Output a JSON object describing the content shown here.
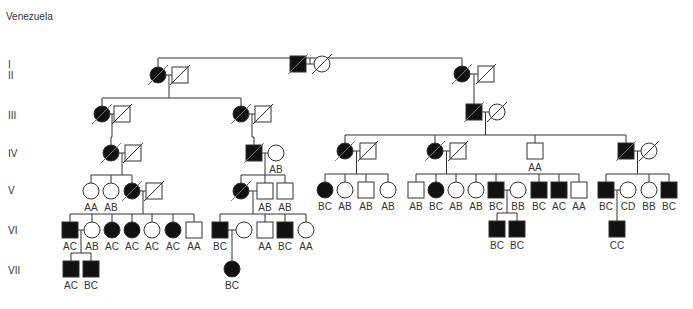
{
  "title": "Venezuela",
  "generations": [
    "I",
    "II",
    "III",
    "IV",
    "V",
    "VI",
    "VII"
  ],
  "gen_y": [
    64,
    75,
    115,
    153,
    190,
    230,
    270
  ],
  "colors": {
    "line": "#333333",
    "affected": "#111111",
    "unaffected": "#ffffff"
  },
  "individuals": [
    {
      "id": "I-1",
      "sex": "M",
      "affected": true,
      "deceased": true,
      "x": 298,
      "y": 64,
      "genotype": ""
    },
    {
      "id": "I-2",
      "sex": "F",
      "affected": false,
      "deceased": true,
      "x": 322,
      "y": 64,
      "genotype": ""
    },
    {
      "id": "II-1",
      "sex": "F",
      "affected": true,
      "deceased": true,
      "x": 158,
      "y": 75,
      "genotype": ""
    },
    {
      "id": "II-2",
      "sex": "M",
      "affected": false,
      "deceased": true,
      "x": 180,
      "y": 75,
      "genotype": ""
    },
    {
      "id": "II-3",
      "sex": "F",
      "affected": true,
      "deceased": true,
      "x": 462,
      "y": 74,
      "genotype": ""
    },
    {
      "id": "II-4",
      "sex": "M",
      "affected": false,
      "deceased": true,
      "x": 486,
      "y": 74,
      "genotype": ""
    },
    {
      "id": "III-1",
      "sex": "F",
      "affected": true,
      "deceased": true,
      "x": 102,
      "y": 114,
      "genotype": ""
    },
    {
      "id": "III-2",
      "sex": "M",
      "affected": false,
      "deceased": true,
      "x": 122,
      "y": 114,
      "genotype": ""
    },
    {
      "id": "III-3",
      "sex": "F",
      "affected": true,
      "deceased": true,
      "x": 241,
      "y": 114,
      "genotype": ""
    },
    {
      "id": "III-4",
      "sex": "M",
      "affected": false,
      "deceased": true,
      "x": 263,
      "y": 114,
      "genotype": ""
    },
    {
      "id": "III-5",
      "sex": "M",
      "affected": true,
      "deceased": true,
      "x": 474,
      "y": 112,
      "genotype": ""
    },
    {
      "id": "III-6",
      "sex": "F",
      "affected": false,
      "deceased": true,
      "x": 497,
      "y": 112,
      "genotype": ""
    },
    {
      "id": "IV-1",
      "sex": "F",
      "affected": true,
      "deceased": true,
      "x": 111,
      "y": 153,
      "genotype": ""
    },
    {
      "id": "IV-2",
      "sex": "M",
      "affected": false,
      "deceased": true,
      "x": 133,
      "y": 153,
      "genotype": ""
    },
    {
      "id": "IV-3",
      "sex": "M",
      "affected": true,
      "deceased": true,
      "x": 254,
      "y": 153,
      "genotype": ""
    },
    {
      "id": "IV-4",
      "sex": "F",
      "affected": false,
      "deceased": false,
      "x": 276,
      "y": 153,
      "genotype": "AB"
    },
    {
      "id": "IV-5",
      "sex": "F",
      "affected": true,
      "deceased": true,
      "x": 345,
      "y": 151,
      "genotype": ""
    },
    {
      "id": "IV-6",
      "sex": "M",
      "affected": false,
      "deceased": true,
      "x": 368,
      "y": 151,
      "genotype": ""
    },
    {
      "id": "IV-7",
      "sex": "F",
      "affected": true,
      "deceased": true,
      "x": 435,
      "y": 151,
      "genotype": ""
    },
    {
      "id": "IV-8",
      "sex": "M",
      "affected": false,
      "deceased": true,
      "x": 458,
      "y": 151,
      "genotype": ""
    },
    {
      "id": "IV-9",
      "sex": "M",
      "affected": false,
      "deceased": false,
      "x": 535,
      "y": 151,
      "genotype": "AA"
    },
    {
      "id": "IV-10",
      "sex": "M",
      "affected": true,
      "deceased": true,
      "x": 626,
      "y": 151,
      "genotype": ""
    },
    {
      "id": "IV-11",
      "sex": "F",
      "affected": false,
      "deceased": true,
      "x": 649,
      "y": 151,
      "genotype": ""
    },
    {
      "id": "V-1",
      "sex": "F",
      "affected": false,
      "deceased": false,
      "x": 91,
      "y": 191,
      "genotype": "AA"
    },
    {
      "id": "V-2",
      "sex": "F",
      "affected": false,
      "deceased": false,
      "x": 111,
      "y": 191,
      "genotype": "AB"
    },
    {
      "id": "V-3",
      "sex": "F",
      "affected": true,
      "deceased": true,
      "x": 132,
      "y": 191,
      "genotype": ""
    },
    {
      "id": "V-4",
      "sex": "M",
      "affected": false,
      "deceased": true,
      "x": 154,
      "y": 191,
      "genotype": ""
    },
    {
      "id": "V-5",
      "sex": "F",
      "affected": true,
      "deceased": true,
      "x": 241,
      "y": 191,
      "genotype": ""
    },
    {
      "id": "V-6",
      "sex": "M",
      "affected": false,
      "deceased": false,
      "x": 265,
      "y": 191,
      "genotype": "AB"
    },
    {
      "id": "V-7",
      "sex": "M",
      "affected": false,
      "deceased": false,
      "x": 285,
      "y": 191,
      "genotype": "AB"
    },
    {
      "id": "V-8",
      "sex": "F",
      "affected": true,
      "deceased": false,
      "x": 325,
      "y": 190,
      "genotype": "BC"
    },
    {
      "id": "V-9",
      "sex": "F",
      "affected": false,
      "deceased": false,
      "x": 345,
      "y": 190,
      "genotype": "AB"
    },
    {
      "id": "V-10",
      "sex": "M",
      "affected": false,
      "deceased": false,
      "x": 366,
      "y": 190,
      "genotype": "AB"
    },
    {
      "id": "V-11",
      "sex": "F",
      "affected": false,
      "deceased": false,
      "x": 388,
      "y": 190,
      "genotype": "AB"
    },
    {
      "id": "V-12",
      "sex": "M",
      "affected": false,
      "deceased": false,
      "x": 416,
      "y": 190,
      "genotype": "AB"
    },
    {
      "id": "V-13",
      "sex": "F",
      "affected": true,
      "deceased": false,
      "x": 436,
      "y": 190,
      "genotype": "BC"
    },
    {
      "id": "V-14",
      "sex": "F",
      "affected": false,
      "deceased": false,
      "x": 456,
      "y": 190,
      "genotype": "AB"
    },
    {
      "id": "V-15",
      "sex": "F",
      "affected": false,
      "deceased": false,
      "x": 476,
      "y": 190,
      "genotype": "AB"
    },
    {
      "id": "V-16",
      "sex": "M",
      "affected": true,
      "deceased": false,
      "x": 496,
      "y": 190,
      "genotype": "BC"
    },
    {
      "id": "V-17",
      "sex": "F",
      "affected": false,
      "deceased": false,
      "x": 518,
      "y": 190,
      "genotype": "BB"
    },
    {
      "id": "V-18",
      "sex": "M",
      "affected": true,
      "deceased": false,
      "x": 539,
      "y": 190,
      "genotype": "BC"
    },
    {
      "id": "V-19",
      "sex": "M",
      "affected": true,
      "deceased": false,
      "x": 559,
      "y": 190,
      "genotype": "AC"
    },
    {
      "id": "V-20",
      "sex": "M",
      "affected": false,
      "deceased": false,
      "x": 579,
      "y": 190,
      "genotype": "AA"
    },
    {
      "id": "V-21",
      "sex": "M",
      "affected": true,
      "deceased": false,
      "x": 606,
      "y": 190,
      "genotype": "BC"
    },
    {
      "id": "V-22",
      "sex": "F",
      "affected": false,
      "deceased": false,
      "x": 628,
      "y": 190,
      "genotype": "CD"
    },
    {
      "id": "V-23",
      "sex": "F",
      "affected": false,
      "deceased": false,
      "x": 649,
      "y": 190,
      "genotype": "BB"
    },
    {
      "id": "V-24",
      "sex": "M",
      "affected": true,
      "deceased": false,
      "x": 669,
      "y": 190,
      "genotype": "BC"
    },
    {
      "id": "VI-1",
      "sex": "M",
      "affected": true,
      "deceased": false,
      "x": 70,
      "y": 230,
      "genotype": "AC"
    },
    {
      "id": "VI-2",
      "sex": "F",
      "affected": false,
      "deceased": false,
      "x": 92,
      "y": 230,
      "genotype": "AB"
    },
    {
      "id": "VI-3",
      "sex": "F",
      "affected": true,
      "deceased": false,
      "x": 112,
      "y": 230,
      "genotype": "AC"
    },
    {
      "id": "VI-4",
      "sex": "F",
      "affected": true,
      "deceased": false,
      "x": 132,
      "y": 230,
      "genotype": "AC"
    },
    {
      "id": "VI-5",
      "sex": "F",
      "affected": false,
      "deceased": false,
      "x": 152,
      "y": 230,
      "genotype": "AC"
    },
    {
      "id": "VI-6",
      "sex": "F",
      "affected": true,
      "deceased": false,
      "x": 173,
      "y": 230,
      "genotype": "AC"
    },
    {
      "id": "VI-7",
      "sex": "M",
      "affected": false,
      "deceased": false,
      "x": 194,
      "y": 230,
      "genotype": "AA"
    },
    {
      "id": "VI-8",
      "sex": "M",
      "affected": true,
      "deceased": false,
      "x": 220,
      "y": 230,
      "genotype": "BC"
    },
    {
      "id": "VI-9",
      "sex": "F",
      "affected": false,
      "deceased": false,
      "x": 244,
      "y": 230,
      "genotype": ""
    },
    {
      "id": "VI-10",
      "sex": "M",
      "affected": false,
      "deceased": false,
      "x": 265,
      "y": 230,
      "genotype": "AA"
    },
    {
      "id": "VI-11",
      "sex": "M",
      "affected": true,
      "deceased": false,
      "x": 285,
      "y": 230,
      "genotype": "BC"
    },
    {
      "id": "VI-12",
      "sex": "F",
      "affected": false,
      "deceased": false,
      "x": 306,
      "y": 230,
      "genotype": "AA"
    },
    {
      "id": "VI-13",
      "sex": "M",
      "affected": true,
      "deceased": false,
      "x": 497,
      "y": 229,
      "genotype": "BC"
    },
    {
      "id": "VI-14",
      "sex": "M",
      "affected": true,
      "deceased": false,
      "x": 517,
      "y": 229,
      "genotype": "BC"
    },
    {
      "id": "VI-15",
      "sex": "M",
      "affected": true,
      "deceased": false,
      "x": 617,
      "y": 229,
      "genotype": "CC"
    },
    {
      "id": "VII-1",
      "sex": "M",
      "affected": true,
      "deceased": false,
      "x": 71,
      "y": 269,
      "genotype": "AC"
    },
    {
      "id": "VII-2",
      "sex": "M",
      "affected": true,
      "deceased": false,
      "x": 91,
      "y": 269,
      "genotype": "BC"
    },
    {
      "id": "VII-3",
      "sex": "F",
      "affected": true,
      "deceased": false,
      "x": 232,
      "y": 269,
      "genotype": "BC"
    }
  ],
  "couples": [
    {
      "a": "I-1",
      "b": "I-2",
      "children": [
        "II-1",
        "II-3"
      ]
    },
    {
      "a": "II-1",
      "b": "II-2",
      "children": [
        "III-1",
        "III-3"
      ]
    },
    {
      "a": "II-3",
      "b": "II-4",
      "children": [
        "III-5"
      ]
    },
    {
      "a": "III-1",
      "b": "III-2",
      "children": [
        "IV-1"
      ]
    },
    {
      "a": "III-3",
      "b": "III-4",
      "children": [
        "IV-3"
      ]
    },
    {
      "a": "III-5",
      "b": "III-6",
      "children": [
        "IV-5",
        "IV-7",
        "IV-9",
        "IV-10"
      ]
    },
    {
      "a": "IV-1",
      "b": "IV-2",
      "children": [
        "V-1",
        "V-2",
        "V-3"
      ]
    },
    {
      "a": "IV-3",
      "b": "IV-4",
      "children": [
        "V-5",
        "V-6",
        "V-7"
      ]
    },
    {
      "a": "IV-5",
      "b": "IV-6",
      "children": [
        "V-8",
        "V-9",
        "V-10",
        "V-11"
      ]
    },
    {
      "a": "IV-7",
      "b": "IV-8",
      "children": [
        "V-12",
        "V-13",
        "V-14",
        "V-15",
        "V-16",
        "V-18",
        "V-19",
        "V-20"
      ]
    },
    {
      "a": "IV-10",
      "b": "IV-11",
      "children": [
        "V-21",
        "V-23",
        "V-24"
      ]
    },
    {
      "a": "V-3",
      "b": "V-4",
      "children": [
        "VI-1",
        "VI-2",
        "VI-3",
        "VI-4",
        "VI-5",
        "VI-6",
        "VI-7"
      ]
    },
    {
      "a": "V-5",
      "b": "V-6",
      "children": [
        "VI-8",
        "VI-10",
        "VI-11",
        "VI-12"
      ]
    },
    {
      "a": "V-16",
      "b": "V-17",
      "children": [
        "VI-13",
        "VI-14"
      ]
    },
    {
      "a": "V-21",
      "b": "V-22",
      "children": [
        "VI-15"
      ]
    },
    {
      "a": "VI-1",
      "b": "VI-2",
      "children": [
        "VII-1",
        "VII-2"
      ]
    },
    {
      "a": "VI-8",
      "b": "VI-9",
      "children": [
        "VII-3"
      ]
    }
  ]
}
